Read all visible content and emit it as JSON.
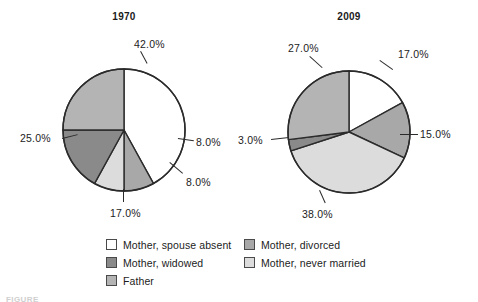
{
  "chart_data": [
    {
      "type": "pie",
      "title": "1970",
      "categories": [
        "Mother, spouse absent",
        "Mother, divorced",
        "Mother, never married",
        "Mother, widowed",
        "Father"
      ],
      "values": [
        42.0,
        8.0,
        8.0,
        17.0,
        25.0
      ],
      "labels": [
        "42.0%",
        "8.0%",
        "8.0%",
        "17.0%",
        "25.0%"
      ],
      "colors": [
        "#ffffff",
        "#a8a8a8",
        "#dcdcdc",
        "#8a8a8a",
        "#b4b4b4"
      ],
      "start_angle": 0,
      "direction": "clockwise",
      "legend_position": "bottom"
    },
    {
      "type": "pie",
      "title": "2009",
      "categories": [
        "Mother, spouse absent",
        "Mother, divorced",
        "Mother, never married",
        "Mother, widowed",
        "Father"
      ],
      "values": [
        17.0,
        15.0,
        38.0,
        3.0,
        27.0
      ],
      "labels": [
        "17.0%",
        "15.0%",
        "38.0%",
        "3.0%",
        "27.0%"
      ],
      "colors": [
        "#ffffff",
        "#a8a8a8",
        "#dcdcdc",
        "#8a8a8a",
        "#b4b4b4"
      ],
      "start_angle": 0,
      "direction": "clockwise",
      "legend_position": "bottom"
    }
  ],
  "titles": {
    "left": "1970",
    "right": "2009"
  },
  "labels_1970": {
    "spouse_absent": "42.0%",
    "divorced": "8.0%",
    "never_married": "8.0%",
    "widowed": "17.0%",
    "father": "25.0%"
  },
  "labels_2009": {
    "spouse_absent": "17.0%",
    "divorced": "15.0%",
    "never_married": "38.0%",
    "widowed": "3.0%",
    "father": "27.0%"
  },
  "legend": {
    "left_column": [
      {
        "label": "Mother, spouse absent",
        "color": "#ffffff"
      },
      {
        "label": "Mother, widowed",
        "color": "#8a8a8a"
      },
      {
        "label": "Father",
        "color": "#b4b4b4"
      }
    ],
    "right_column": [
      {
        "label": "Mother, divorced",
        "color": "#a8a8a8"
      },
      {
        "label": "Mother, never married",
        "color": "#dcdcdc"
      }
    ]
  },
  "caption": {
    "text": "FIGURE"
  },
  "style": {
    "stroke": "#2b2b2b",
    "text": "#1c1c1c",
    "background": "#ffffff"
  }
}
